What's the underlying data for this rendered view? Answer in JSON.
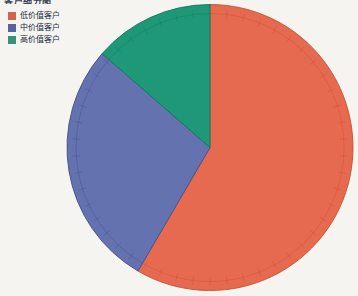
{
  "window": {
    "width": 358,
    "height": 296,
    "background": "#f5f4f1"
  },
  "clipped_title": "客户细分图",
  "legend": {
    "position": "top-left",
    "text_color": "#232c40",
    "items": [
      {
        "label": "低价值客户",
        "color": "#cf6450"
      },
      {
        "label": "中价值客户",
        "color": "#55639f"
      },
      {
        "label": "高价值客户",
        "color": "#35917a"
      }
    ]
  },
  "chart_data": {
    "type": "pie",
    "title": "",
    "categories": [
      "低价值客户",
      "中价值客户",
      "高价值客户"
    ],
    "values_percent": [
      58.4,
      28.0,
      13.6
    ],
    "series": [
      {
        "name": "低价值客户",
        "percent": 58.4,
        "color": "#e66a4f",
        "edge_color": "#c4512f"
      },
      {
        "name": "中价值客户",
        "percent": 28.0,
        "color": "#6472af",
        "edge_color": "#3f4f8e"
      },
      {
        "name": "高价值客户",
        "percent": 13.6,
        "color": "#1f9878",
        "edge_color": "#0c7a5c"
      }
    ],
    "start_angle": "12-oclock",
    "direction": "clockwise",
    "tick_interval_percent": 2,
    "inner_ring": true,
    "legend_position": "top-left",
    "data_labels_shown": false
  }
}
